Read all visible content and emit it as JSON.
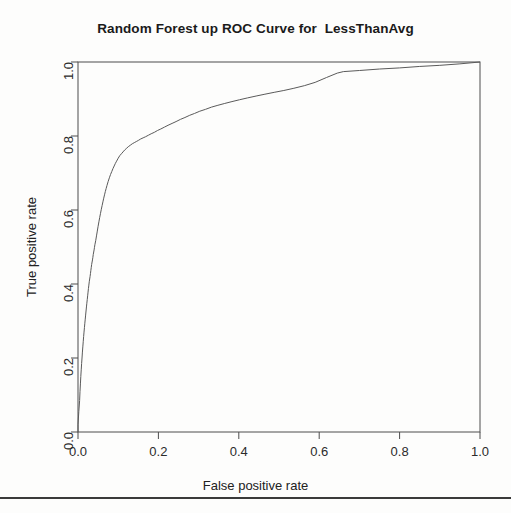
{
  "chart_data": {
    "type": "line",
    "title": "Random Forest up ROC Curve for  LessThanAvg",
    "xlabel": "False positive rate",
    "ylabel": "True positive rate",
    "xlim": [
      0,
      1
    ],
    "ylim": [
      0,
      1
    ],
    "grid": false,
    "legend": null,
    "xticks": [
      "0.0",
      "0.2",
      "0.4",
      "0.6",
      "0.8",
      "1.0"
    ],
    "xtick_values": [
      0.0,
      0.2,
      0.4,
      0.6,
      0.8,
      1.0
    ],
    "yticks": [
      "0.0",
      "0.2",
      "0.4",
      "0.6",
      "0.8",
      "1.0"
    ],
    "ytick_values": [
      0.0,
      0.2,
      0.4,
      0.6,
      0.8,
      1.0
    ],
    "line_color": "#5a5a5a",
    "series": [
      {
        "name": "ROC curve",
        "x": [
          0.0,
          0.0,
          0.002,
          0.004,
          0.005,
          0.006,
          0.007,
          0.008,
          0.009,
          0.01,
          0.011,
          0.012,
          0.013,
          0.014,
          0.015,
          0.016,
          0.017,
          0.018,
          0.019,
          0.02,
          0.021,
          0.022,
          0.023,
          0.024,
          0.025,
          0.026,
          0.027,
          0.028,
          0.03,
          0.031,
          0.032,
          0.033,
          0.034,
          0.036,
          0.037,
          0.038,
          0.04,
          0.041,
          0.042,
          0.044,
          0.046,
          0.048,
          0.05,
          0.052,
          0.054,
          0.056,
          0.058,
          0.06,
          0.062,
          0.064,
          0.066,
          0.068,
          0.07,
          0.072,
          0.075,
          0.078,
          0.081,
          0.084,
          0.087,
          0.09,
          0.093,
          0.096,
          0.1,
          0.104,
          0.108,
          0.112,
          0.116,
          0.12,
          0.125,
          0.13,
          0.135,
          0.14,
          0.145,
          0.15,
          0.156,
          0.162,
          0.168,
          0.175,
          0.182,
          0.19,
          0.198,
          0.206,
          0.215,
          0.224,
          0.234,
          0.244,
          0.255,
          0.266,
          0.278,
          0.29,
          0.303,
          0.317,
          0.332,
          0.348,
          0.365,
          0.383,
          0.402,
          0.422,
          0.443,
          0.465,
          0.488,
          0.512,
          0.537,
          0.563,
          0.59,
          0.618,
          0.645,
          0.66,
          0.7,
          0.75,
          0.8,
          0.85,
          0.9,
          0.95,
          0.98,
          1.0
        ],
        "y": [
          0.0,
          0.02,
          0.055,
          0.085,
          0.11,
          0.13,
          0.15,
          0.168,
          0.185,
          0.2,
          0.216,
          0.23,
          0.244,
          0.258,
          0.27,
          0.282,
          0.294,
          0.305,
          0.316,
          0.327,
          0.338,
          0.348,
          0.358,
          0.368,
          0.378,
          0.388,
          0.397,
          0.406,
          0.42,
          0.428,
          0.437,
          0.445,
          0.453,
          0.465,
          0.472,
          0.48,
          0.492,
          0.499,
          0.506,
          0.517,
          0.53,
          0.543,
          0.556,
          0.568,
          0.58,
          0.591,
          0.602,
          0.612,
          0.622,
          0.632,
          0.641,
          0.65,
          0.658,
          0.666,
          0.677,
          0.687,
          0.696,
          0.704,
          0.712,
          0.719,
          0.726,
          0.732,
          0.74,
          0.747,
          0.752,
          0.757,
          0.762,
          0.766,
          0.771,
          0.775,
          0.779,
          0.782,
          0.785,
          0.788,
          0.792,
          0.795,
          0.798,
          0.802,
          0.806,
          0.81,
          0.815,
          0.819,
          0.824,
          0.829,
          0.834,
          0.839,
          0.845,
          0.85,
          0.856,
          0.861,
          0.867,
          0.872,
          0.878,
          0.883,
          0.888,
          0.893,
          0.898,
          0.903,
          0.908,
          0.913,
          0.918,
          0.923,
          0.929,
          0.936,
          0.945,
          0.958,
          0.97,
          0.974,
          0.977,
          0.981,
          0.984,
          0.988,
          0.991,
          0.995,
          0.998,
          1.0
        ]
      }
    ]
  }
}
